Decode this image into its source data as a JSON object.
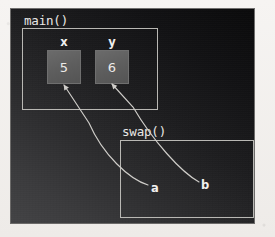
{
  "diagram": {
    "title_main": "main()",
    "title_swap": "swap()",
    "variables": [
      {
        "name": "x",
        "value": "5"
      },
      {
        "name": "y",
        "value": "6"
      }
    ],
    "pointers": [
      {
        "label": "a",
        "points_to": "x"
      },
      {
        "label": "b",
        "points_to": "y"
      }
    ],
    "colors": {
      "panel_dark": "#0a0a0b",
      "panel_light": "#434345",
      "frame_stroke": "#b9b8b4",
      "cell_fill": "#5e5e5e",
      "text": "#eceae8",
      "arrow": "#cfcdc9"
    }
  }
}
